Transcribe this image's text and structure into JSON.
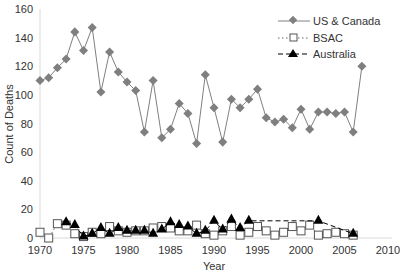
{
  "chart_data": {
    "type": "line",
    "title": "",
    "xlabel": "Year",
    "ylabel": "Count of Deaths",
    "xlim": [
      1970,
      2010
    ],
    "ylim": [
      0,
      160
    ],
    "x_ticks": [
      1970,
      1975,
      1980,
      1985,
      1990,
      1995,
      2000,
      2005,
      2010
    ],
    "y_ticks": [
      0,
      20,
      40,
      60,
      80,
      100,
      120,
      140,
      160
    ],
    "grid": false,
    "legend_position": "top-right",
    "series": [
      {
        "name": "US & Canada",
        "marker": "diamond",
        "line": "solid",
        "color": "#808080",
        "x": [
          1970,
          1971,
          1972,
          1973,
          1974,
          1975,
          1976,
          1977,
          1978,
          1979,
          1980,
          1981,
          1982,
          1983,
          1984,
          1985,
          1986,
          1987,
          1988,
          1989,
          1990,
          1991,
          1992,
          1993,
          1994,
          1995,
          1996,
          1997,
          1998,
          1999,
          2000,
          2001,
          2002,
          2003,
          2004,
          2005,
          2006,
          2007
        ],
        "values": [
          110,
          112,
          119,
          125,
          144,
          131,
          147,
          102,
          130,
          116,
          109,
          103,
          74,
          110,
          70,
          76,
          94,
          87,
          66,
          114,
          91,
          67,
          97,
          91,
          97,
          104,
          84,
          81,
          83,
          77,
          90,
          76,
          88,
          88,
          87,
          88,
          74,
          120
        ]
      },
      {
        "name": "BSAC",
        "marker": "square",
        "line": "dotted",
        "color": "#666666",
        "x": [
          1970,
          1971,
          1972,
          1973,
          1974,
          1975,
          1976,
          1977,
          1978,
          1979,
          1980,
          1981,
          1982,
          1983,
          1984,
          1985,
          1986,
          1987,
          1988,
          1989,
          1990,
          1991,
          1992,
          1993,
          1994,
          1995,
          1996,
          1997,
          1998,
          1999,
          2000,
          2001,
          2002,
          2003,
          2004,
          2005,
          2006
        ],
        "values": [
          4,
          0,
          10,
          9,
          3,
          1,
          4,
          3,
          8,
          5,
          4,
          5,
          5,
          7,
          8,
          7,
          5,
          5,
          9,
          3,
          2,
          5,
          8,
          2,
          4,
          8,
          5,
          2,
          4,
          8,
          5,
          9,
          2,
          3,
          4,
          3,
          2
        ]
      },
      {
        "name": "Australia",
        "marker": "triangle",
        "line": "dashed",
        "color": "#000000",
        "x": [
          1973,
          1974,
          1975,
          1976,
          1977,
          1978,
          1979,
          1980,
          1981,
          1982,
          1983,
          1984,
          1985,
          1986,
          1987,
          1988,
          1989,
          1990,
          1991,
          1992,
          1993,
          1994,
          2002,
          2006
        ],
        "values": [
          11,
          9,
          1,
          3,
          7,
          3,
          7,
          5,
          5,
          5,
          3,
          6,
          11,
          9,
          8,
          3,
          5,
          12,
          6,
          13,
          7,
          12,
          12,
          3
        ]
      }
    ]
  },
  "legend": {
    "items": [
      {
        "label": "US & Canada"
      },
      {
        "label": "BSAC"
      },
      {
        "label": "Australia"
      }
    ]
  },
  "axes": {
    "xlabel": "Year",
    "ylabel": "Count of Deaths"
  }
}
